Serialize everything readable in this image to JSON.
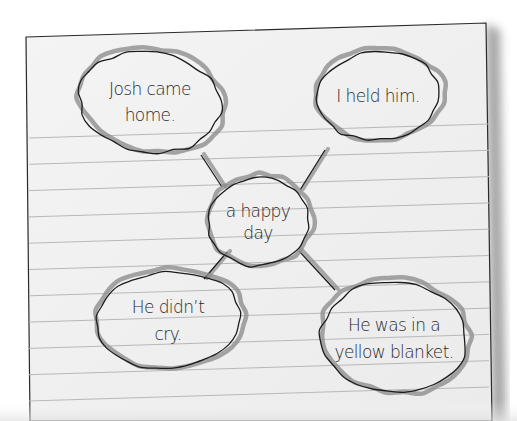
{
  "diagram": {
    "type": "idea-web",
    "colors": {
      "paper": "#f1f1f1",
      "ruled_line": "#b8b8b8",
      "outline_ink": "#1c1c1c",
      "highlight_pencil": "#8f8f8f",
      "text_ink": "#2a2a2a",
      "shadow": "#6e6e6e"
    },
    "center": {
      "id": "center",
      "lines": [
        "a happy",
        "day"
      ]
    },
    "details": [
      {
        "id": "josh-came-home",
        "lines": [
          "Josh came",
          "home."
        ]
      },
      {
        "id": "i-held-him",
        "lines": [
          "I held him."
        ]
      },
      {
        "id": "he-didnt-cry",
        "lines": [
          "He didn’t",
          "cry."
        ]
      },
      {
        "id": "yellow-blanket",
        "lines": [
          "He was in a",
          "yellow blanket."
        ]
      }
    ]
  }
}
